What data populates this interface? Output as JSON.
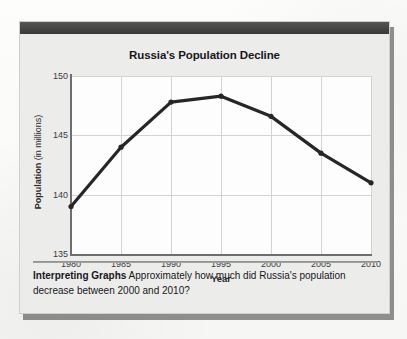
{
  "panel": {
    "title": "Russia's Population Decline"
  },
  "caption": {
    "label": "Interpreting Graphs",
    "question": "Approximately how much did Russia's population decrease between 2000 and 2010?"
  },
  "axes": {
    "y_title_bold": "Population",
    "y_title_rest": " (in millions)",
    "x_title": "Year",
    "y_ticks": [
      "135",
      "140",
      "145",
      "150"
    ],
    "x_ticks": [
      "1980",
      "1985",
      "1990",
      "1995",
      "2000",
      "2005",
      "2010"
    ]
  },
  "colors": {
    "line": "#262626",
    "header_bar": "#444442",
    "panel_background": "#ececeb",
    "plot_background": "#fdfdfd",
    "gridline": "#d3d3d3",
    "axis": "#6e6e6e"
  },
  "chart_data": {
    "type": "line",
    "title": "Russia's Population Decline",
    "xlabel": "Year",
    "ylabel": "Population (in millions)",
    "x": [
      1980,
      1985,
      1990,
      1995,
      2000,
      2005,
      2010
    ],
    "categories": [
      "1980",
      "1985",
      "1990",
      "1995",
      "2000",
      "2005",
      "2010"
    ],
    "values": [
      139.0,
      144.0,
      147.8,
      148.3,
      146.6,
      143.5,
      141.0
    ],
    "series": [
      {
        "name": "Population",
        "values": [
          139.0,
          144.0,
          147.8,
          148.3,
          146.6,
          143.5,
          141.0
        ]
      }
    ],
    "xlim": [
      1980,
      2010
    ],
    "ylim": [
      135,
      150
    ],
    "ytick_values": [
      135,
      140,
      145,
      150
    ],
    "xtick_values": [
      1980,
      1985,
      1990,
      1995,
      2000,
      2005,
      2010
    ],
    "grid": true,
    "legend": "none",
    "markers": true
  }
}
